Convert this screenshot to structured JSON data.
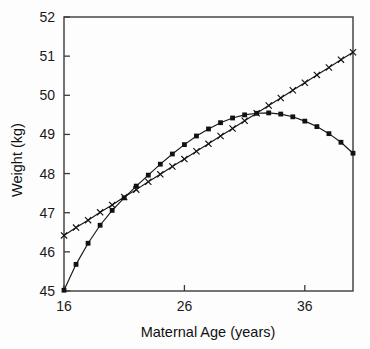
{
  "chart_data": {
    "type": "line",
    "title": "",
    "xlabel": "Maternal Age (years)",
    "ylabel": "Weight (kg)",
    "xlim": [
      16,
      40
    ],
    "ylim": [
      45,
      52
    ],
    "xticks": [
      16,
      26,
      36
    ],
    "xticklabels": [
      "16",
      "26",
      "36"
    ],
    "yticks": [
      45,
      46,
      47,
      48,
      49,
      50,
      51,
      52
    ],
    "yticklabels": [
      "45",
      "46",
      "47",
      "48",
      "49",
      "50",
      "51",
      "52"
    ],
    "grid": false,
    "legend": "none",
    "series": [
      {
        "name": "quadratic-fit",
        "marker": "square",
        "x": [
          16,
          17,
          18,
          19,
          20,
          21,
          22,
          23,
          24,
          25,
          26,
          27,
          28,
          29,
          30,
          31,
          32,
          33,
          34,
          35,
          36,
          37,
          38,
          39,
          40
        ],
        "values": [
          45.02,
          45.68,
          46.22,
          46.68,
          47.06,
          47.38,
          47.68,
          47.96,
          48.24,
          48.5,
          48.74,
          48.96,
          49.14,
          49.3,
          49.42,
          49.5,
          49.54,
          49.55,
          49.52,
          49.45,
          49.34,
          49.2,
          49.02,
          48.8,
          48.52
        ]
      },
      {
        "name": "linear-fit",
        "marker": "x",
        "x": [
          16,
          17,
          18,
          19,
          20,
          21,
          22,
          23,
          24,
          25,
          26,
          27,
          28,
          29,
          30,
          31,
          32,
          33,
          34,
          35,
          36,
          37,
          38,
          39,
          40
        ],
        "values": [
          46.42,
          46.62,
          46.81,
          47.01,
          47.2,
          47.4,
          47.59,
          47.79,
          47.98,
          48.18,
          48.37,
          48.57,
          48.76,
          48.96,
          49.15,
          49.35,
          49.54,
          49.74,
          49.93,
          50.13,
          50.32,
          50.52,
          50.71,
          50.91,
          51.1
        ]
      }
    ]
  },
  "colors": {
    "axis": "#3a3a3a",
    "series": "#121212",
    "background": "#fdfdfd"
  }
}
